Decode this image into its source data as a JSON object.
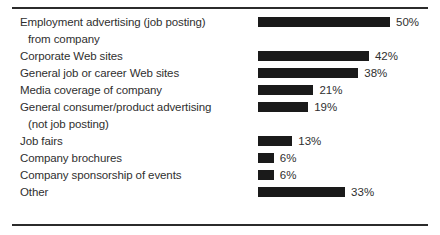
{
  "chart_data": {
    "type": "bar",
    "orientation": "horizontal",
    "title": "",
    "xlabel": "",
    "ylabel": "",
    "xlim": [
      0,
      50
    ],
    "grid": false,
    "legend": false,
    "value_suffix": "%",
    "categories": [
      "Employment advertising (job posting) from company",
      "Corporate Web sites",
      "General job or career Web sites",
      "Media coverage of company",
      "General consumer/product advertising (not job posting)",
      "Job fairs",
      "Company brochures",
      "Company sponsorship of events",
      "Other"
    ],
    "values": [
      50,
      42,
      38,
      21,
      19,
      13,
      6,
      6,
      33
    ],
    "value_labels": [
      "50%",
      "42%",
      "38%",
      "21%",
      "19%",
      "13%",
      "6%",
      "6%",
      "33%"
    ],
    "bar_color": "#1a1a1a",
    "rows": [
      {
        "line1": "Employment advertising (job posting)",
        "line2": "from company",
        "value": 50,
        "value_label": "50%"
      },
      {
        "line1": "Corporate Web sites",
        "line2": "",
        "value": 42,
        "value_label": "42%"
      },
      {
        "line1": "General job or career Web sites",
        "line2": "",
        "value": 38,
        "value_label": "38%"
      },
      {
        "line1": "Media coverage of company",
        "line2": "",
        "value": 21,
        "value_label": "21%"
      },
      {
        "line1": "General consumer/product advertising",
        "line2": "(not job posting)",
        "value": 19,
        "value_label": "19%"
      },
      {
        "line1": "Job fairs",
        "line2": "",
        "value": 13,
        "value_label": "13%"
      },
      {
        "line1": "Company brochures",
        "line2": "",
        "value": 6,
        "value_label": "6%"
      },
      {
        "line1": "Company sponsorship of events",
        "line2": "",
        "value": 6,
        "value_label": "6%"
      },
      {
        "line1": "Other",
        "line2": "",
        "value": 33,
        "value_label": "33%"
      }
    ]
  }
}
